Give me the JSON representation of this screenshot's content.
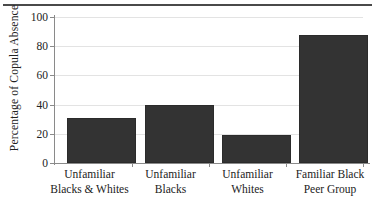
{
  "chart_data": {
    "type": "bar",
    "title": "",
    "xlabel": "",
    "ylabel": "Percentage of Copula Absence",
    "categories": [
      "Unfamiliar Blacks & Whites",
      "Unfamiliar Blacks",
      "Unfamiliar Whites",
      "Familiar Black Peer Group"
    ],
    "category_lines": [
      [
        "Unfamiliar",
        "Blacks & Whites"
      ],
      [
        "Unfamiliar",
        "Blacks"
      ],
      [
        "Unfamiliar",
        "Whites"
      ],
      [
        "Familiar Black",
        "Peer Group"
      ]
    ],
    "values": [
      31,
      40,
      19,
      88
    ],
    "ylim": [
      0,
      100
    ],
    "yticks": [
      0,
      20,
      40,
      60,
      80,
      100
    ],
    "ytick_labels": [
      "0",
      "20",
      "40",
      "60",
      "80",
      "100"
    ],
    "grid": true,
    "legend": null,
    "bar_color": "#333333",
    "grid_color": "#e3e3e3",
    "axis_color": "#8a8a8a",
    "rule_color": "#4a4a4a"
  }
}
